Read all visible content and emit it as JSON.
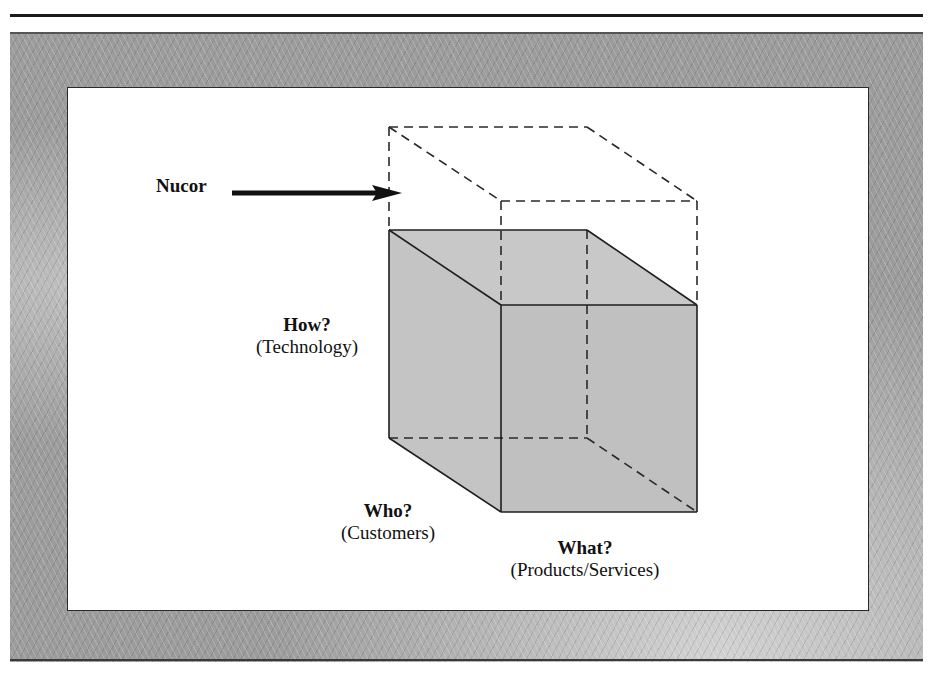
{
  "diagram": {
    "subject_label": "Nucor",
    "axes": [
      {
        "id": "how",
        "question": "How?",
        "dimension": "(Technology)"
      },
      {
        "id": "who",
        "question": "Who?",
        "dimension": "(Customers)"
      },
      {
        "id": "what",
        "question": "What?",
        "dimension": "(Products/Services)"
      }
    ],
    "colors": {
      "cube_fill": "#c4c4c4",
      "line": "#1e1e1e",
      "frame_texture": "#9c9c9c",
      "panel": "#ffffff"
    }
  }
}
